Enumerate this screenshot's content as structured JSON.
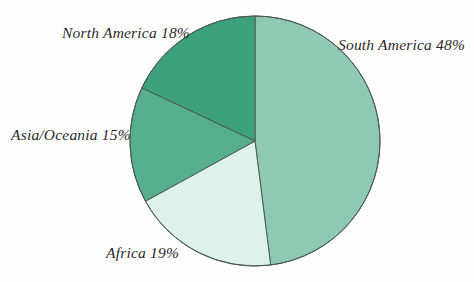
{
  "chart_data": {
    "type": "pie",
    "title": "",
    "subtitle": "",
    "xlabel": "",
    "ylabel": "",
    "legend_position": "none",
    "grid": false,
    "label_format": "{name} {value}%",
    "total": 100,
    "units": "percent",
    "start_angle_deg": 0,
    "direction": "clockwise",
    "categories": [
      "South America",
      "Africa",
      "Asia/Oceania",
      "North America"
    ],
    "values": [
      48,
      19,
      15,
      18
    ],
    "slices": [
      {
        "name": "South America",
        "value": 48,
        "label": "South America 48%",
        "color": "#8FC9B4",
        "start_deg": 0,
        "end_deg": 172.8
      },
      {
        "name": "Africa",
        "value": 19,
        "label": "Africa 19%",
        "color": "#DCF2EA",
        "start_deg": 172.8,
        "end_deg": 241.2
      },
      {
        "name": "Asia/Oceania",
        "value": 15,
        "label": "Asia/Oceania 15%",
        "color": "#55AE8C",
        "start_deg": 241.2,
        "end_deg": 295.2
      },
      {
        "name": "North America",
        "value": 18,
        "label": "North America 18%",
        "color": "#3DA17C",
        "start_deg": 295.2,
        "end_deg": 360
      }
    ]
  },
  "style": {
    "background": "#fefefe",
    "stroke": "#4a5a52",
    "stroke_width": 1,
    "text_color": "#2b2b2b"
  },
  "geometry": {
    "center_x": 255,
    "center_y": 141,
    "radius": 125
  }
}
